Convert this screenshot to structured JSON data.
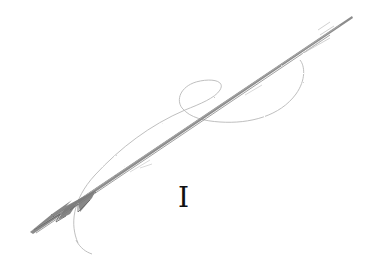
{
  "illustration": {
    "subject": "harpoon-with-rope",
    "style": "pencil-sketch",
    "caption": "I",
    "colors": {
      "background": "#ffffff",
      "shaft": "#8a8a8a",
      "shaft_dark": "#6b6b6b",
      "rope": "#b5b5b5",
      "caption": "#111111"
    }
  }
}
